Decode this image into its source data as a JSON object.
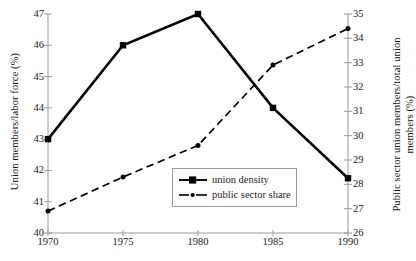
{
  "chart_data": {
    "type": "line",
    "title": "",
    "xlabel": "",
    "x": [
      1970,
      1975,
      1980,
      1985,
      1990
    ],
    "xticklabels": [
      "1970",
      "1975",
      "1980",
      "1985",
      "1990"
    ],
    "grid": false,
    "legend_position": "lower center",
    "axes": {
      "left": {
        "label": "Union members/labor force (%)",
        "ylim": [
          40,
          47
        ],
        "ticks": [
          40,
          41,
          42,
          43,
          44,
          45,
          46,
          47
        ],
        "ticklabels": [
          "40",
          "41",
          "42",
          "43",
          "44",
          "45",
          "46",
          "47"
        ]
      },
      "right": {
        "label": "Public sector union members/total union members (%)",
        "label_line1": "Public sector union members/total union",
        "label_line2": "members (%)",
        "ylim": [
          26,
          35
        ],
        "ticks": [
          26,
          27,
          28,
          29,
          30,
          31,
          32,
          33,
          34,
          35
        ],
        "ticklabels": [
          "26",
          "27",
          "28",
          "29",
          "30",
          "31",
          "32",
          "33",
          "34",
          "35"
        ]
      }
    },
    "series": [
      {
        "name": "union density",
        "axis": "left",
        "linestyle": "solid",
        "marker": "square",
        "color": "#000000",
        "values": [
          43.0,
          46.0,
          47.0,
          44.0,
          41.75
        ]
      },
      {
        "name": "public sector share",
        "axis": "right",
        "linestyle": "dashed",
        "marker": "dot",
        "color": "#000000",
        "values": [
          26.9,
          28.3,
          29.6,
          32.9,
          34.4
        ]
      }
    ]
  },
  "legend": {
    "items": [
      {
        "label": "union density"
      },
      {
        "label": "public sector share"
      }
    ]
  },
  "colors": {
    "axis": "#9a9a9a",
    "line": "#000000",
    "text": "#111111",
    "legend_border": "#9a9a9a",
    "background": "#ffffff"
  }
}
